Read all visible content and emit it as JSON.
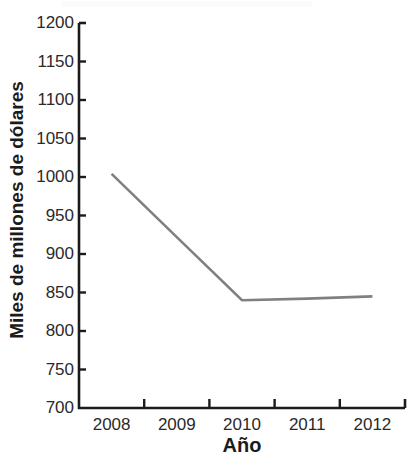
{
  "chart_data": {
    "type": "line",
    "title": "",
    "xlabel": "Año",
    "ylabel": "Miles de millones de dólares",
    "categories": [
      "2008",
      "2009",
      "2010",
      "2011",
      "2012"
    ],
    "x": [
      2008,
      2009,
      2010,
      2011,
      2012
    ],
    "series": [
      {
        "name": "",
        "values": [
          1004,
          922,
          840,
          842,
          845
        ],
        "color": "#808080"
      }
    ],
    "values": [
      1004,
      922,
      840,
      842,
      845
    ],
    "ylim": [
      700,
      1200
    ],
    "yticks": [
      700,
      750,
      800,
      850,
      900,
      950,
      1000,
      1050,
      1100,
      1150,
      1200
    ],
    "ytick_labels": [
      "700",
      "750",
      "800",
      "850",
      "900",
      "950",
      "1000",
      "1050",
      "1100",
      "1150",
      "1200"
    ],
    "xtick_labels": [
      "2008",
      "2009",
      "2010",
      "2011",
      "2012"
    ],
    "grid": false,
    "legend": null,
    "legend_position": "none",
    "axis_color": "#1b1b1b",
    "line_color": "#808080",
    "background": "#ffffff"
  },
  "axes": {
    "y_title": "Miles de millones de dólares",
    "x_title": "Año"
  }
}
